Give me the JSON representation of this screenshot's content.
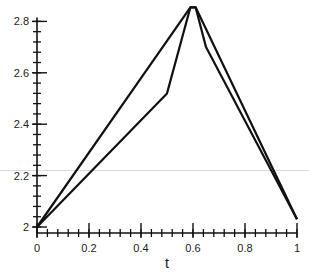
{
  "chart_data": {
    "type": "line",
    "title": "",
    "xlabel": "t",
    "ylabel": "",
    "xlim": [
      0,
      1
    ],
    "ylim": [
      2,
      2.85
    ],
    "x_ticks": [
      0,
      0.2,
      0.4,
      0.6,
      0.8,
      1
    ],
    "x_tick_labels": [
      "0",
      "0.2",
      "0.4",
      "0.6",
      "0.8",
      "1"
    ],
    "y_ticks": [
      2,
      2.2,
      2.4,
      2.6,
      2.8
    ],
    "y_tick_labels": [
      "2",
      "2.2",
      "2.4",
      "2.6",
      "2.8"
    ],
    "x_minor_step": 0.04,
    "y_minor_step": 0.04,
    "grid": false,
    "legend": "none",
    "series": [
      {
        "name": "path-1",
        "x": [
          0,
          0.59,
          0.61,
          1
        ],
        "y": [
          2.0,
          2.855,
          2.855,
          2.03
        ]
      },
      {
        "name": "path-2",
        "x": [
          0,
          0.5,
          0.59,
          0.61,
          0.65,
          1
        ],
        "y": [
          2.0,
          2.52,
          2.855,
          2.855,
          2.7,
          2.03
        ]
      }
    ],
    "reference_line": {
      "y": 2.22,
      "color": "#d8d8d8"
    }
  }
}
